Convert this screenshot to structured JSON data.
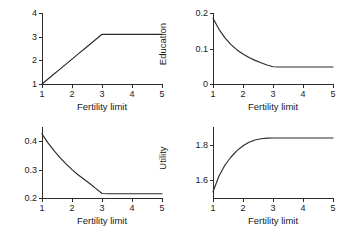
{
  "figure": {
    "background": "#ffffff",
    "line_color": "#2b2b2b",
    "axis_color": "#2b2b2b"
  },
  "chart_data": [
    {
      "type": "line",
      "panel": "top-left",
      "title": "",
      "xlabel": "Fertility limit",
      "ylabel": "Fertility",
      "xlim": [
        1,
        5
      ],
      "ylim": [
        1,
        4
      ],
      "xticks": [
        1,
        2,
        3,
        4,
        5
      ],
      "xticklabels": [
        "1",
        "2",
        "3",
        "4",
        "5"
      ],
      "yticks": [
        1,
        2,
        3,
        4
      ],
      "yticklabels": [
        "1",
        "2",
        "3",
        "4"
      ],
      "grid": false,
      "legend": null,
      "x": [
        1.0,
        1.2,
        1.4,
        1.6,
        1.8,
        2.0,
        2.2,
        2.4,
        2.6,
        2.8,
        3.0,
        3.2,
        3.4,
        3.6,
        3.8,
        4.0,
        4.2,
        4.4,
        4.6,
        4.8,
        5.0
      ],
      "y": [
        1.0,
        1.21,
        1.42,
        1.63,
        1.84,
        2.05,
        2.26,
        2.47,
        2.68,
        2.89,
        3.1,
        3.1,
        3.1,
        3.1,
        3.1,
        3.1,
        3.1,
        3.1,
        3.1,
        3.1,
        3.1
      ]
    },
    {
      "type": "line",
      "panel": "top-right",
      "title": "",
      "xlabel": "Fertility limit",
      "ylabel": "Education",
      "xlim": [
        1,
        5
      ],
      "ylim": [
        0,
        0.2
      ],
      "xticks": [
        1,
        2,
        3,
        4,
        5
      ],
      "xticklabels": [
        "1",
        "2",
        "3",
        "4",
        "5"
      ],
      "yticks": [
        0,
        0.1,
        0.2
      ],
      "yticklabels": [
        "0",
        "0.1",
        "0.2"
      ],
      "grid": false,
      "legend": null,
      "x": [
        1.0,
        1.2,
        1.4,
        1.6,
        1.8,
        2.0,
        2.2,
        2.4,
        2.6,
        2.8,
        3.0,
        3.2,
        3.4,
        3.6,
        3.8,
        4.0,
        4.2,
        4.4,
        4.6,
        4.8,
        5.0
      ],
      "y": [
        0.185,
        0.154,
        0.13,
        0.111,
        0.096,
        0.0845,
        0.0745,
        0.0665,
        0.06,
        0.0535,
        0.0485,
        0.048,
        0.048,
        0.048,
        0.048,
        0.048,
        0.048,
        0.048,
        0.048,
        0.048,
        0.048
      ]
    },
    {
      "type": "line",
      "panel": "bottom-left",
      "title": "",
      "xlabel": "Fertility limit",
      "ylabel": "Growth rate",
      "xlim": [
        1,
        5
      ],
      "ylim": [
        0.2,
        0.45
      ],
      "xticks": [
        1,
        2,
        3,
        4,
        5
      ],
      "xticklabels": [
        "1",
        "2",
        "3",
        "4",
        "5"
      ],
      "yticks": [
        0.2,
        0.3,
        0.4
      ],
      "yticklabels": [
        "0.2",
        "0.3",
        "0.4"
      ],
      "grid": false,
      "legend": null,
      "x": [
        1.0,
        1.2,
        1.4,
        1.6,
        1.8,
        2.0,
        2.2,
        2.4,
        2.6,
        2.8,
        3.0,
        3.2,
        3.4,
        3.6,
        3.8,
        4.0,
        4.2,
        4.4,
        4.6,
        4.8,
        5.0
      ],
      "y": [
        0.425,
        0.394,
        0.367,
        0.342,
        0.32,
        0.3,
        0.282,
        0.266,
        0.25,
        0.233,
        0.216,
        0.215,
        0.215,
        0.215,
        0.215,
        0.215,
        0.215,
        0.215,
        0.215,
        0.215,
        0.215
      ]
    },
    {
      "type": "line",
      "panel": "bottom-right",
      "title": "",
      "xlabel": "Fertility limit",
      "ylabel": "Utility",
      "xlim": [
        1,
        5
      ],
      "ylim": [
        1.5,
        1.9
      ],
      "xticks": [
        1,
        2,
        3,
        4,
        5
      ],
      "xticklabels": [
        "1",
        "2",
        "3",
        "4",
        "5"
      ],
      "yticks": [
        1.6,
        1.8
      ],
      "yticklabels": [
        "1.6",
        "1.8"
      ],
      "grid": false,
      "legend": null,
      "x": [
        1.0,
        1.2,
        1.4,
        1.6,
        1.8,
        2.0,
        2.2,
        2.4,
        2.6,
        2.8,
        3.0,
        3.2,
        3.4,
        3.6,
        3.8,
        4.0,
        4.2,
        4.4,
        4.6,
        4.8,
        5.0
      ],
      "y": [
        1.535,
        1.624,
        1.686,
        1.731,
        1.767,
        1.794,
        1.814,
        1.827,
        1.834,
        1.8375,
        1.838,
        1.838,
        1.838,
        1.838,
        1.838,
        1.838,
        1.838,
        1.838,
        1.838,
        1.838,
        1.838
      ]
    }
  ]
}
